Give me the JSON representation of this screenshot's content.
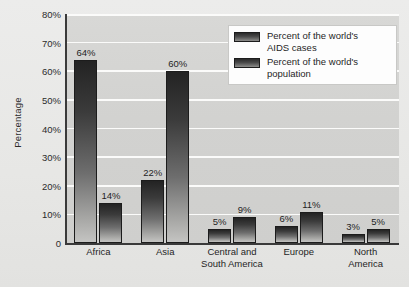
{
  "chart_data": {
    "type": "bar",
    "title": "",
    "xlabel": "",
    "ylabel": "Percentage",
    "ylim": [
      0,
      80
    ],
    "ytick_step": 10,
    "grid": true,
    "legend_position": "top-right",
    "categories": [
      "Africa",
      "Central and South America",
      "Asia",
      "Europe",
      "North America"
    ],
    "category_lines": [
      [
        "Africa"
      ],
      [
        "Asia"
      ],
      [
        "Central and",
        "South America"
      ],
      [
        "Europe"
      ],
      [
        "North",
        "America"
      ]
    ],
    "ytick_labels": [
      "80%",
      "70%",
      "60%",
      "50%",
      "40%",
      "30%",
      "20%",
      "10%",
      "0"
    ],
    "ytick_values": [
      80,
      70,
      60,
      50,
      40,
      30,
      20,
      10,
      0
    ],
    "series": [
      {
        "name": "Percent of the world's AIDS cases",
        "name_lines": [
          "Percent of the world's",
          "AIDS cases"
        ],
        "values": [
          64,
          22,
          5,
          6,
          3
        ],
        "value_labels": [
          "64%",
          "22%",
          "5%",
          "6%",
          "3%"
        ],
        "color": "#3b3b3b"
      },
      {
        "name": "Percent of the world's population",
        "name_lines": [
          "Percent of the world's",
          "population"
        ],
        "values": [
          14,
          60,
          9,
          11,
          5
        ],
        "value_labels": [
          "14%",
          "60%",
          "9%",
          "11%",
          "5%"
        ],
        "color": "#3b3b3b"
      }
    ]
  },
  "colors": {
    "page_background": "#e9e9e7",
    "plot_background": "#d4d4d2",
    "gridline": "#fbfbfa",
    "axis": "#3a3a3a",
    "text": "#1f1f1f",
    "bar_dark": "#232323",
    "bar_light": "#c4c4c2",
    "legend_background": "#fdfdfd",
    "legend_border": "#c8c8c6"
  }
}
